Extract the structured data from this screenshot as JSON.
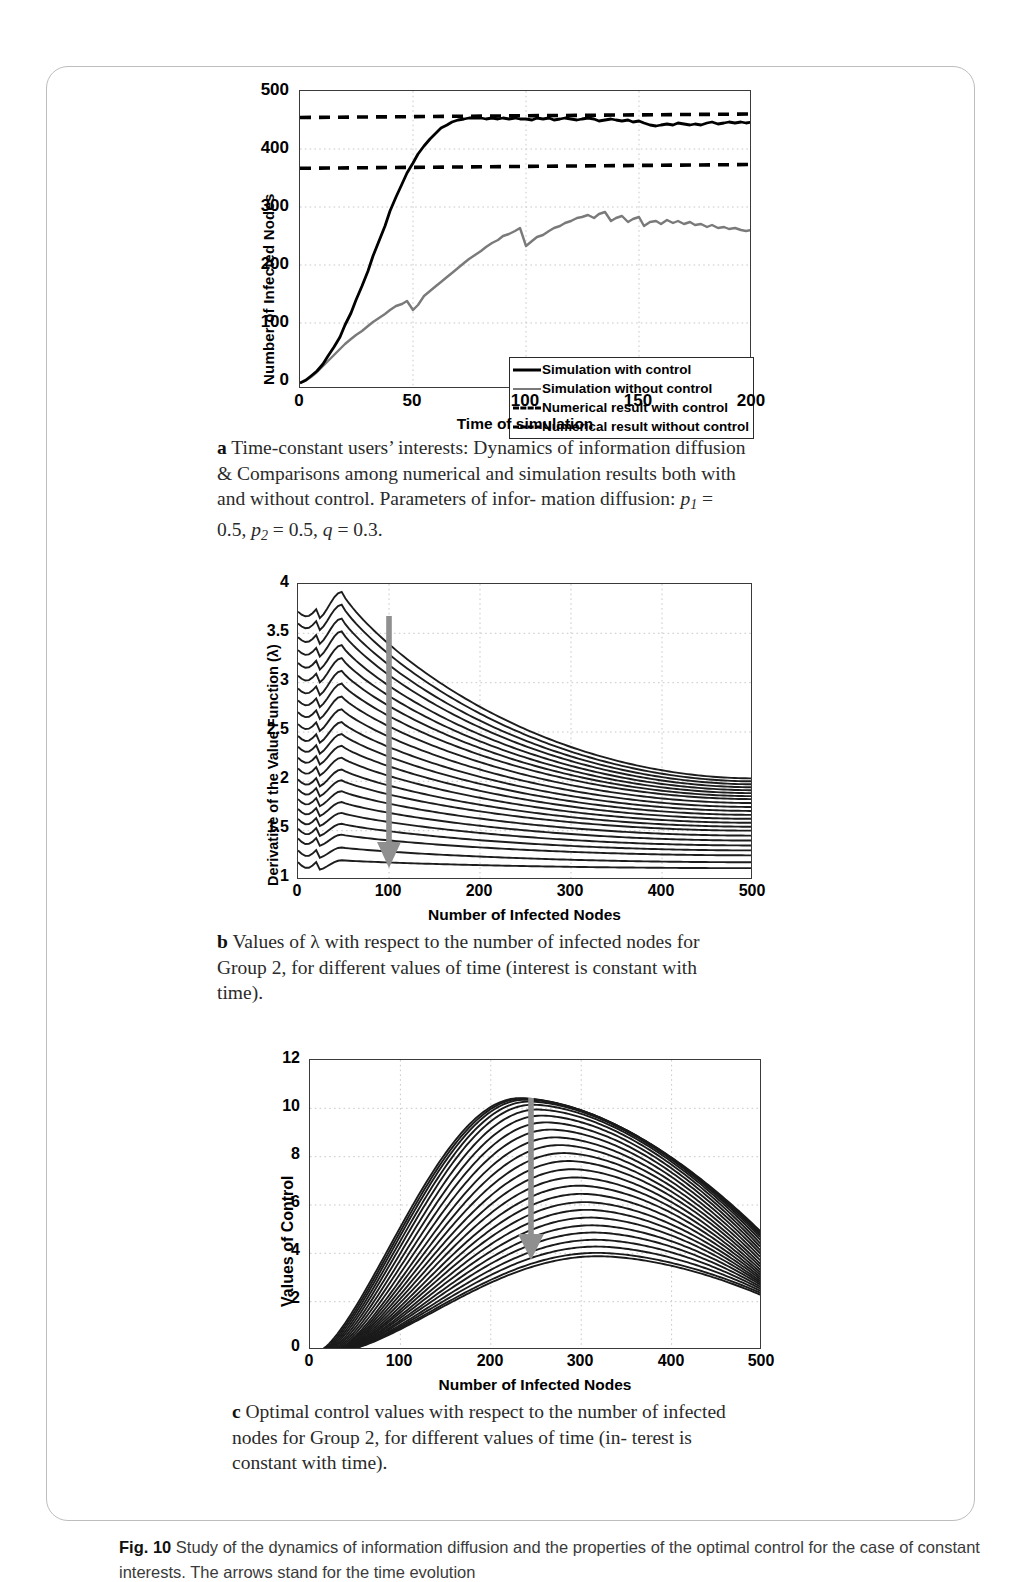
{
  "figure": {
    "number_label": "Fig. 10",
    "caption": "Study of the dynamics of information diffusion and the properties of the optimal control for the case of constant interests. The arrows stand for the time evolution"
  },
  "panels": [
    {
      "key": "a",
      "label": "a",
      "caption_lines": [
        "Time-constant users’ interests: Dynamics of information",
        "diffusion & Comparisons among numerical and simulation",
        "results both with and without control. Parameters of infor-",
        "mation diffusion: p1 = 0.5,  p2 = 0.5, q = 0.3."
      ],
      "caption_text": "Time-constant users’ interests: Dynamics of information diffusion & Comparisons among numerical and simulation results both with and without control. Parameters of information diffusion: p1 = 0.5, p2 = 0.5, q = 0.3.",
      "parameters": [
        {
          "symbol": "p",
          "subscript": "1",
          "value": "0.5"
        },
        {
          "symbol": "p",
          "subscript": "2",
          "value": "0.5"
        },
        {
          "symbol": "q",
          "subscript": "",
          "value": "0.3"
        }
      ]
    },
    {
      "key": "b",
      "label": "b",
      "caption_lines": [
        "Values of λ with respect to the number of infected nodes",
        "for Group 2, for different values of time (interest is constant",
        "with time)."
      ],
      "caption_text": "Values of λ with respect to the number of infected nodes for Group 2, for different values of time (interest is constant with time)."
    },
    {
      "key": "c",
      "label": "c",
      "caption_lines": [
        "Optimal control values with respect to the number of",
        "infected nodes for Group 2, for different values of time (in-",
        "terest is constant with time)."
      ],
      "caption_text": "Optimal control values with respect to the number of infected nodes for Group 2, for different values of time (interest is constant with time)."
    }
  ],
  "chart_data": [
    {
      "id": "panel-a",
      "type": "line",
      "title": "",
      "xlabel": "Time of simulation",
      "ylabel": "Number of Infected Nodes",
      "xlim": [
        0,
        200
      ],
      "ylim": [
        0,
        500
      ],
      "xticks": [
        0,
        50,
        100,
        150,
        200
      ],
      "yticks": [
        0,
        100,
        200,
        300,
        400,
        500
      ],
      "xtick_labels": [
        "0",
        "50",
        "100",
        "150",
        "200"
      ],
      "ytick_labels": [
        "0",
        "100",
        "200",
        "300",
        "400",
        "500"
      ],
      "grid": true,
      "legend_position": "inside-bottom-right",
      "legend": [
        {
          "label": "Simulation with control",
          "style": "solid",
          "color": "#000000",
          "width": 3
        },
        {
          "label": "Simulation without control",
          "style": "solid",
          "color": "#7a7a7a",
          "width": 2.2
        },
        {
          "label": "Numerical result with control",
          "style": "dashed",
          "color": "#000000",
          "width": 3
        },
        {
          "label": "Numerical result without control",
          "style": "dashed",
          "color": "#000000",
          "width": 3
        }
      ],
      "series": [
        {
          "name": "Simulation with control",
          "style": "solid",
          "color": "#000000",
          "x": [
            0,
            5,
            10,
            15,
            20,
            25,
            30,
            35,
            40,
            45,
            50,
            55,
            60,
            65,
            70,
            75,
            80,
            85,
            90,
            95,
            100,
            105,
            110,
            115,
            120,
            125,
            130,
            135,
            140,
            145,
            150,
            155,
            160,
            165,
            170,
            175,
            180,
            185,
            190,
            195,
            200
          ],
          "y": [
            10,
            22,
            40,
            62,
            95,
            135,
            185,
            245,
            305,
            360,
            405,
            432,
            447,
            450,
            452,
            453,
            451,
            449,
            450,
            451,
            450,
            448,
            449,
            451,
            450,
            447,
            449,
            450,
            451,
            448,
            446,
            447,
            440,
            438,
            441,
            443,
            440,
            442,
            445,
            443,
            444
          ]
        },
        {
          "name": "Simulation without control",
          "style": "solid",
          "color": "#7a7a7a",
          "x": [
            0,
            5,
            10,
            15,
            20,
            25,
            30,
            35,
            40,
            45,
            50,
            55,
            60,
            65,
            70,
            75,
            80,
            85,
            90,
            95,
            100,
            105,
            110,
            115,
            120,
            125,
            130,
            135,
            140,
            145,
            150,
            155,
            160,
            165,
            170,
            175,
            180,
            185,
            190,
            195,
            200
          ],
          "y": [
            10,
            20,
            32,
            45,
            58,
            72,
            84,
            96,
            108,
            118,
            124,
            132,
            145,
            160,
            172,
            186,
            198,
            210,
            222,
            232,
            240,
            248,
            256,
            262,
            268,
            275,
            281,
            276,
            279,
            287,
            275,
            271,
            268,
            276,
            272,
            277,
            276,
            270,
            271,
            268,
            266
          ]
        },
        {
          "name": "Numerical result with control",
          "style": "dashed",
          "color": "#000000",
          "x": [
            0,
            200
          ],
          "y": [
            452,
            460
          ],
          "constant_level": 455
        },
        {
          "name": "Numerical result without control",
          "style": "dashed",
          "color": "#000000",
          "x": [
            0,
            200
          ],
          "y": [
            366,
            372
          ],
          "constant_level": 368
        }
      ]
    },
    {
      "id": "panel-b",
      "type": "line",
      "title": "",
      "xlabel": "Number of Infected Nodes",
      "ylabel": "Derivative of the Value Function (λ)",
      "xlim": [
        0,
        500
      ],
      "ylim": [
        1,
        4
      ],
      "xticks": [
        0,
        100,
        200,
        300,
        400,
        500
      ],
      "yticks": [
        1,
        1.5,
        2,
        2.5,
        3,
        3.5,
        4
      ],
      "xtick_labels": [
        "0",
        "100",
        "200",
        "300",
        "400",
        "500"
      ],
      "ytick_labels": [
        "1",
        "1.5",
        "2",
        "2.5",
        "3",
        "3.5",
        "4"
      ],
      "grid": true,
      "legend_position": "none",
      "annotation": {
        "type": "arrow",
        "label": "time evolution",
        "color": "#8a8a8a",
        "x": 100,
        "y_start": 3.67,
        "y_end": 1.22
      },
      "n_curves": 23,
      "curve_family": {
        "description": "Family of λ(n) curves for increasing time; each curve starts high at n=0, rises to a local peak near n=45, then decays monotonically toward n=500.",
        "start_values": [
          3.72,
          3.6,
          3.46,
          3.33,
          3.2,
          3.07,
          2.94,
          2.82,
          2.7,
          2.58,
          2.46,
          2.35,
          2.24,
          2.13,
          2.02,
          1.92,
          1.82,
          1.72,
          1.62,
          1.52,
          1.42,
          1.3,
          1.18
        ],
        "peak_values": [
          3.92,
          3.79,
          3.65,
          3.52,
          3.38,
          3.25,
          3.12,
          2.99,
          2.86,
          2.73,
          2.6,
          2.48,
          2.36,
          2.24,
          2.12,
          2.01,
          1.9,
          1.79,
          1.68,
          1.57,
          1.46,
          1.33,
          1.2
        ],
        "peak_x": 48,
        "end_values": [
          2.03,
          2.0,
          1.97,
          1.94,
          1.91,
          1.88,
          1.85,
          1.82,
          1.78,
          1.74,
          1.7,
          1.66,
          1.62,
          1.58,
          1.54,
          1.5,
          1.45,
          1.4,
          1.35,
          1.3,
          1.25,
          1.18,
          1.12
        ]
      }
    },
    {
      "id": "panel-c",
      "type": "line",
      "title": "",
      "xlabel": "Number of Infected Nodes",
      "ylabel": "Values of Control",
      "xlim": [
        0,
        500
      ],
      "ylim": [
        0,
        12
      ],
      "xticks": [
        0,
        100,
        200,
        300,
        400,
        500
      ],
      "yticks": [
        0,
        2,
        4,
        6,
        8,
        10,
        12
      ],
      "xtick_labels": [
        "0",
        "100",
        "200",
        "300",
        "400",
        "500"
      ],
      "ytick_labels": [
        "0",
        "2",
        "4",
        "6",
        "8",
        "10",
        "12"
      ],
      "grid": true,
      "legend_position": "none",
      "annotation": {
        "type": "arrow",
        "label": "time evolution",
        "color": "#8a8a8a",
        "x": 245,
        "y_start": 10.4,
        "y_end": 3.75
      },
      "n_curves": 26,
      "curve_family": {
        "description": "Family of optimal-control curves rising from ~0 near n=15-40, peaking between n=230 and n=320, then decreasing toward n=500.",
        "peak_values": [
          10.42,
          10.4,
          10.36,
          10.28,
          10.15,
          9.95,
          9.7,
          9.42,
          9.12,
          8.8,
          8.48,
          8.15,
          7.82,
          7.48,
          7.14,
          6.8,
          6.46,
          6.12,
          5.8,
          5.48,
          5.16,
          4.86,
          4.56,
          4.28,
          4.02,
          3.88
        ],
        "peak_x": [
          232,
          235,
          238,
          242,
          246,
          251,
          256,
          261,
          266,
          271,
          276,
          281,
          286,
          290,
          294,
          298,
          301,
          304,
          307,
          310,
          312,
          314,
          316,
          317,
          318,
          319
        ],
        "zero_x": [
          12,
          14,
          16,
          18,
          20,
          22,
          24,
          26,
          28,
          30,
          31,
          32,
          33,
          34,
          35,
          36,
          37,
          37,
          38,
          38,
          39,
          39,
          40,
          40,
          40,
          41
        ],
        "end_values": [
          4.85,
          4.78,
          4.7,
          4.6,
          4.48,
          4.34,
          4.2,
          4.06,
          3.92,
          3.78,
          3.64,
          3.5,
          3.38,
          3.26,
          3.15,
          3.05,
          2.96,
          2.88,
          2.8,
          2.73,
          2.66,
          2.58,
          2.5,
          2.42,
          2.34,
          2.26
        ]
      }
    }
  ]
}
